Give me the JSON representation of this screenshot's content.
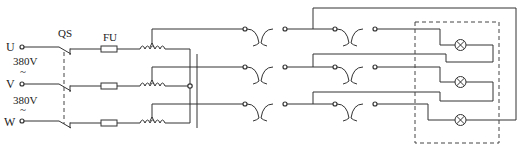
{
  "diagram": {
    "type": "electrical-schematic",
    "labels": {
      "switch": "QS",
      "fuse": "FU",
      "phase_u": "U",
      "phase_v": "V",
      "phase_w": "W",
      "voltage_uv": "380V",
      "voltage_vw": "380V",
      "ac_symbol_1": "~",
      "ac_symbol_2": "~"
    },
    "components": [
      {
        "id": "QS",
        "kind": "three-pole-switch"
      },
      {
        "id": "FU",
        "kind": "fuse",
        "count": 3
      },
      {
        "kind": "autotransformer",
        "count": 3
      },
      {
        "kind": "contact-pair",
        "count": 6
      },
      {
        "kind": "lamp",
        "count": 3
      }
    ],
    "colors": {
      "line": "#333333",
      "background": "#ffffff"
    }
  }
}
